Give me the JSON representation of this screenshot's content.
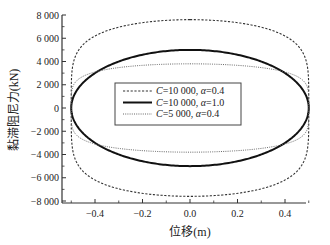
{
  "chart_data": {
    "type": "line",
    "title": "",
    "xlabel": "位移(m)",
    "ylabel": "黏滞阻尼力(kN)",
    "xlim": [
      -0.55,
      0.55
    ],
    "ylim": [
      -8000,
      8000
    ],
    "x_ticks": [
      -0.4,
      -0.2,
      0.0,
      0.2,
      0.4
    ],
    "x_tick_labels": [
      "-0.4",
      "-0.2",
      "0.0",
      "0.2",
      "0.4"
    ],
    "y_ticks": [
      -8000,
      -6000,
      -4000,
      -2000,
      0,
      2000,
      4000,
      6000,
      8000
    ],
    "y_tick_labels": [
      "-8 000",
      "-6 000",
      "-4 000",
      "-2 000",
      "0",
      "2 000",
      "4 000",
      "6 000",
      "8 000"
    ],
    "grid": false,
    "legend_position": "center-left inside",
    "series": [
      {
        "name": "C=10 000, α=0.4",
        "style": "dashed",
        "amplitude_m": 0.5,
        "peak_force_kN": 7600,
        "alpha": 0.4
      },
      {
        "name": "C=10 000, α=1.0",
        "style": "solid",
        "amplitude_m": 0.5,
        "peak_force_kN": 5000,
        "alpha": 1.0
      },
      {
        "name": "C=5 000, α=0.4",
        "style": "dotted",
        "amplitude_m": 0.5,
        "peak_force_kN": 3800,
        "alpha": 0.4
      }
    ]
  },
  "legend": {
    "items": [
      {
        "c": "C",
        "text": "=10 000, ",
        "a": "α",
        "val": "=0.4"
      },
      {
        "c": "C",
        "text": "=10 000, ",
        "a": "α",
        "val": "=1.0"
      },
      {
        "c": "C",
        "text": "=5 000, ",
        "a": "α",
        "val": "=0.4"
      }
    ]
  }
}
